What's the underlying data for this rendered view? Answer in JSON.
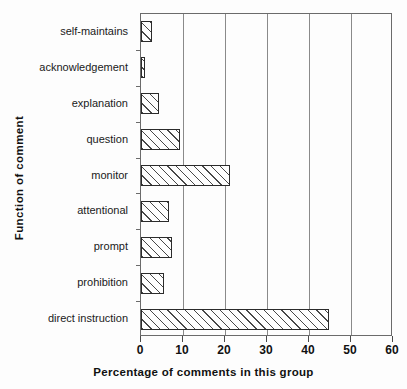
{
  "chart_data": {
    "type": "bar",
    "orientation": "horizontal",
    "title": "",
    "xlabel": "Percentage of comments in this group",
    "ylabel": "Function of comment",
    "xlim": [
      0,
      60
    ],
    "xticks": [
      0,
      10,
      20,
      30,
      40,
      50,
      60
    ],
    "xtick_labels": [
      "0",
      "10",
      "20",
      "30",
      "40",
      "50",
      "60"
    ],
    "grid": "vertical-major",
    "legend": "none",
    "categories": [
      "self-maintains",
      "acknowledgement",
      "explanation",
      "question",
      "monitor",
      "attentional",
      "prompt",
      "prohibition",
      "direct  instruction"
    ],
    "values": [
      2.7,
      1.0,
      4.3,
      9.3,
      21.2,
      6.6,
      7.4,
      5.5,
      44.8
    ],
    "bar_style": {
      "fill": "diagonal-hatch",
      "edge_color": "#2b2b2b",
      "face_color": "#ffffff"
    }
  },
  "axes": {
    "frame_color": "#6b6b6b",
    "gridline_color": "#8a8a8a"
  }
}
